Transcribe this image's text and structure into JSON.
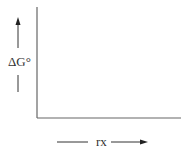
{
  "diagram": {
    "y_axis": {
      "label": "ΔG°",
      "direction": "up"
    },
    "x_axis": {
      "label": "rx",
      "direction": "right"
    },
    "colors": {
      "axis": "#555555",
      "text": "#333333",
      "background": "#ffffff"
    }
  }
}
